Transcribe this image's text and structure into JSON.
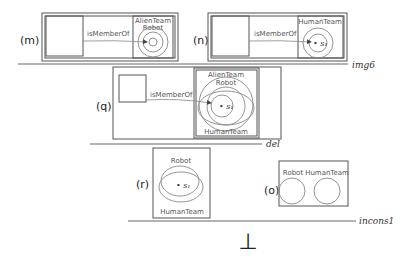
{
  "panels": {
    "m": {
      "label": "(m)",
      "edge": "isMemberOf",
      "outer": "AlienTeam",
      "inner": "Robot"
    },
    "n": {
      "label": "(n)",
      "edge": "isMemberOf",
      "set": "HumanTeam",
      "element": "• s₁"
    },
    "q": {
      "label": "(q)",
      "edge": "isMemberOf",
      "top1": "AlienTeam",
      "top2": "Robot",
      "bottom": "HumanTeam",
      "element": "• s₁"
    },
    "r": {
      "label": "(r)",
      "top": "Robot",
      "bottom": "HumanTeam",
      "element": "• s₁"
    },
    "o": {
      "label": "(o)",
      "left": "Robot",
      "right": "HumanTeam"
    }
  },
  "rules": {
    "img6": "img6",
    "del": "del",
    "incons1": "incons1"
  },
  "bottom_symbol": "⊥"
}
